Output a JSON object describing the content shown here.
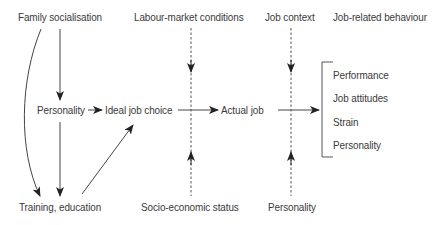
{
  "diagram": {
    "column_headers": {
      "family_socialisation": "Family socialisation",
      "labour_market": "Labour-market conditions",
      "job_context": "Job context",
      "job_related_behaviour": "Job-related behaviour"
    },
    "middle_row": {
      "personality": "Personality",
      "ideal_job_choice": "Ideal job choice",
      "actual_job": "Actual job"
    },
    "outcomes": [
      "Performance",
      "Job attitudes",
      "Strain",
      "Personality"
    ],
    "bottom_row": {
      "training_education": "Training, education",
      "socio_economic_status": "Socio-economic status",
      "personality": "Personality"
    },
    "edges": [
      {
        "from": "Family socialisation",
        "to": "Personality",
        "style": "solid"
      },
      {
        "from": "Family socialisation",
        "to": "Training, education",
        "style": "solid-curved"
      },
      {
        "from": "Personality",
        "to": "Training, education",
        "style": "solid"
      },
      {
        "from": "Personality",
        "to": "Ideal job choice",
        "style": "solid"
      },
      {
        "from": "Training, education",
        "to": "Ideal job choice",
        "style": "solid"
      },
      {
        "from": "Ideal job choice",
        "to": "Actual job",
        "style": "solid"
      },
      {
        "from": "Actual job",
        "to": "Job-related behaviour",
        "style": "solid"
      },
      {
        "from": "Labour-market conditions",
        "to": "Ideal job choice -> Actual job link",
        "style": "dashed"
      },
      {
        "from": "Socio-economic status",
        "to": "Ideal job choice -> Actual job link",
        "style": "dashed"
      },
      {
        "from": "Job context",
        "to": "Actual job -> behaviour link",
        "style": "dashed"
      },
      {
        "from": "Personality (bottom)",
        "to": "Actual job -> behaviour link",
        "style": "dashed"
      }
    ]
  }
}
